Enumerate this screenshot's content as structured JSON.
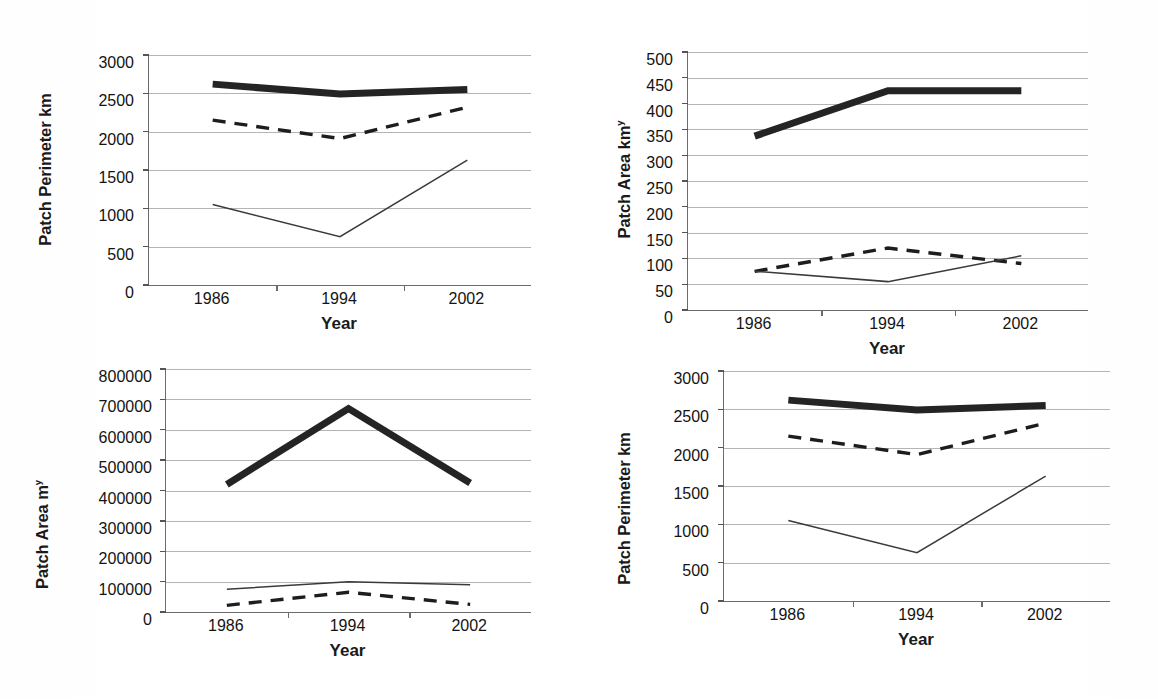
{
  "figure": {
    "panel_count": 4,
    "xlabel": "Year",
    "categories": [
      "1986",
      "1994",
      "2002"
    ]
  },
  "chart_data": [
    {
      "id": "top-left",
      "type": "line",
      "title": "",
      "xlabel": "Year",
      "ylabel": "Patch Perimeter km",
      "x": [
        "1986",
        "1994",
        "2002"
      ],
      "ylim": [
        0,
        3000
      ],
      "yticks": [
        "3000",
        "2500",
        "2000",
        "1500",
        "1000",
        "500",
        "0"
      ],
      "grid": true,
      "legend": "none",
      "series": [
        {
          "name": "thick-solid",
          "style": "thick-solid",
          "values": [
            2620,
            2490,
            2550
          ]
        },
        {
          "name": "dashed",
          "style": "dashed",
          "values": [
            2150,
            1910,
            2320
          ]
        },
        {
          "name": "thin-solid",
          "style": "thin-solid",
          "values": [
            1050,
            630,
            1630
          ]
        }
      ]
    },
    {
      "id": "top-right",
      "type": "line",
      "title": "",
      "xlabel": "Year",
      "ylabel": "Patch Area km",
      "ylabel_sup": "y",
      "x": [
        "1986",
        "1994",
        "2002"
      ],
      "ylim": [
        0,
        500
      ],
      "yticks": [
        "500",
        "450",
        "400",
        "350",
        "300",
        "250",
        "200",
        "150",
        "100",
        "50",
        "0"
      ],
      "grid": true,
      "legend": "none",
      "series": [
        {
          "name": "thick-solid",
          "style": "thick-solid",
          "values": [
            337,
            425,
            425
          ]
        },
        {
          "name": "dashed",
          "style": "dashed",
          "values": [
            75,
            120,
            90
          ]
        },
        {
          "name": "thin-solid",
          "style": "thin-solid",
          "values": [
            75,
            55,
            105
          ]
        }
      ]
    },
    {
      "id": "bottom-left",
      "type": "line",
      "title": "",
      "xlabel": "Year",
      "ylabel": "Patch Area m",
      "ylabel_sup": "y",
      "x": [
        "1986",
        "1994",
        "2002"
      ],
      "ylim": [
        0,
        800000
      ],
      "yticks": [
        "800000",
        "700000",
        "600000",
        "500000",
        "400000",
        "300000",
        "200000",
        "100000",
        "0"
      ],
      "grid": true,
      "legend": "none",
      "series": [
        {
          "name": "thick-solid",
          "style": "thick-solid",
          "values": [
            420000,
            670000,
            425000
          ]
        },
        {
          "name": "thin-solid",
          "style": "thin-solid",
          "values": [
            75000,
            100000,
            90000
          ]
        },
        {
          "name": "dashed",
          "style": "dashed",
          "values": [
            22000,
            65000,
            25000
          ]
        }
      ]
    },
    {
      "id": "bottom-right",
      "type": "line",
      "title": "",
      "xlabel": "Year",
      "ylabel": "Patch Perimeter km",
      "x": [
        "1986",
        "1994",
        "2002"
      ],
      "ylim": [
        0,
        3000
      ],
      "yticks": [
        "3000",
        "2500",
        "2000",
        "1500",
        "1000",
        "500",
        "0"
      ],
      "grid": true,
      "legend": "none",
      "series": [
        {
          "name": "thick-solid",
          "style": "thick-solid",
          "values": [
            2620,
            2490,
            2550
          ]
        },
        {
          "name": "dashed",
          "style": "dashed",
          "values": [
            2150,
            1910,
            2320
          ]
        },
        {
          "name": "thin-solid",
          "style": "thin-solid",
          "values": [
            1050,
            630,
            1630
          ]
        }
      ]
    }
  ]
}
